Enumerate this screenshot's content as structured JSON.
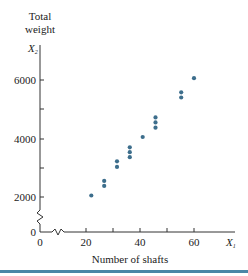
{
  "chart_data": {
    "type": "scatter",
    "title": "",
    "ylabel_lines": [
      "Total",
      "weight"
    ],
    "ylabel_var": "X",
    "ylabel_sub": "2",
    "xlabel": "Number of shafts",
    "xlabel_var": "X",
    "xlabel_sub": "1",
    "x_ticks": [
      0,
      20,
      40,
      60
    ],
    "x_minor_ticks": [
      30,
      50
    ],
    "y_ticks": [
      0,
      2000,
      4000,
      6000
    ],
    "y_minor_ticks": [
      3000,
      5000
    ],
    "axis_breaks": [
      "x between 0 and 20",
      "y between 0 and 2000"
    ],
    "xlim": [
      0,
      72
    ],
    "ylim": [
      0,
      6800
    ],
    "grid": false,
    "legend": null,
    "point_color": "#3d6e8c",
    "x": [
      20,
      25,
      25,
      30,
      30,
      35,
      35,
      35,
      40,
      45,
      45,
      45,
      55,
      55,
      60
    ],
    "y": [
      2050,
      2550,
      2380,
      3220,
      3030,
      3700,
      3530,
      3360,
      4050,
      4720,
      4550,
      4370,
      5580,
      5400,
      6060
    ]
  },
  "labels": {
    "y_title_1": "Total",
    "y_title_2": "weight",
    "y_var": "X",
    "y_sub": "2",
    "x_var": "X",
    "x_sub": "1",
    "x_title": "Number of shafts",
    "y0": "0",
    "y2000": "2000",
    "y4000": "4000",
    "y6000": "6000",
    "x0": "0",
    "x20": "20",
    "x40": "40",
    "x60": "60"
  }
}
